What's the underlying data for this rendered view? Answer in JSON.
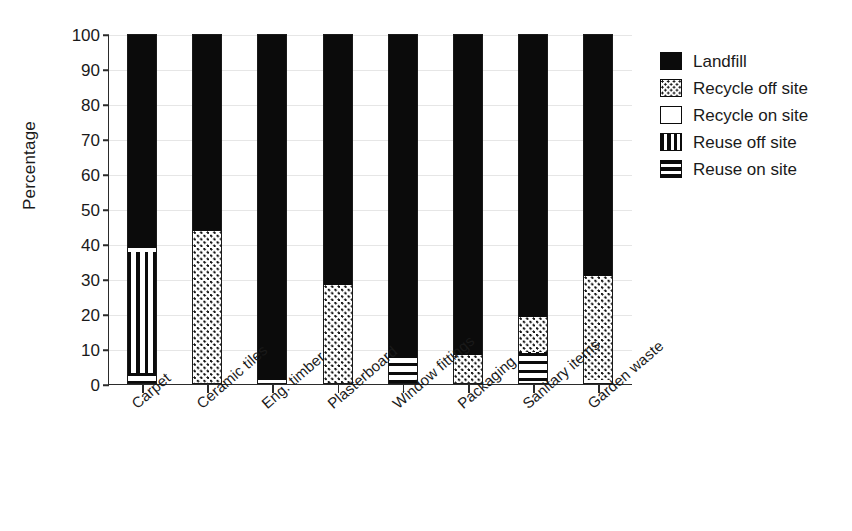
{
  "chart_data": {
    "type": "bar",
    "subtype": "stacked-bar-100-percent",
    "title": "",
    "xlabel": "",
    "ylabel": "Percentage",
    "ylim": [
      0,
      100
    ],
    "yticks": [
      0,
      10,
      20,
      30,
      40,
      50,
      60,
      70,
      80,
      90,
      100
    ],
    "grid": true,
    "legend_position": "right",
    "categories": [
      "Carpet",
      "Ceramic tiles",
      "Eng. timber",
      "Plasterboard",
      "Window fittings",
      "Packaging",
      "Sanitary items",
      "Garden waste"
    ],
    "series": [
      {
        "name": "Reuse on site",
        "pattern": "horizontal-stripes",
        "color": "#0b0b0b",
        "values": [
          3.0,
          0,
          0,
          0,
          8.0,
          0,
          8.5,
          0
        ]
      },
      {
        "name": "Reuse off site",
        "pattern": "vertical-stripes",
        "color": "#0b0b0b",
        "values": [
          34.5,
          0,
          0,
          0,
          0,
          0,
          0.5,
          0
        ]
      },
      {
        "name": "Recycle on site",
        "pattern": "solid-white",
        "color": "#ffffff",
        "values": [
          1.0,
          0,
          1.0,
          0,
          0,
          0,
          0,
          1.0
        ]
      },
      {
        "name": "Recycle off site",
        "pattern": "dotted",
        "color": "#ffffff",
        "values": [
          0,
          43.5,
          0,
          28.0,
          0,
          8.0,
          10.0,
          29.5
        ]
      },
      {
        "name": "Landfill",
        "pattern": "solid-black",
        "color": "#0b0b0b",
        "values": [
          61.5,
          56.5,
          99.0,
          72.0,
          92.0,
          92.0,
          81.0,
          69.5
        ]
      }
    ]
  },
  "legend": {
    "items": [
      {
        "label": "Landfill",
        "fill_class": "fill-landfill"
      },
      {
        "label": "Recycle off site",
        "fill_class": "fill-recycle-off"
      },
      {
        "label": "Recycle on site",
        "fill_class": "fill-recycle-on"
      },
      {
        "label": "Reuse off site",
        "fill_class": "fill-reuse-off"
      },
      {
        "label": "Reuse on site",
        "fill_class": "fill-reuse-on"
      }
    ]
  }
}
